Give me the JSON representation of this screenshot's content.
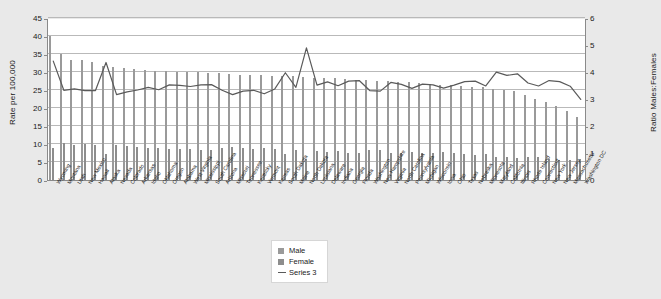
{
  "chart_data": {
    "type": "bar",
    "title": "",
    "subtitle": "",
    "xlabel": "",
    "ylabel": "Rate per 100,000",
    "y2label": "Ratio Males:Females",
    "ylim": [
      0,
      45
    ],
    "y2lim": [
      0,
      6
    ],
    "yticks": [
      0,
      5,
      10,
      15,
      20,
      25,
      30,
      35,
      40,
      45
    ],
    "y2ticks": [
      0,
      1,
      2,
      3,
      4,
      5,
      6
    ],
    "grid": true,
    "legend_position": "bottom-center",
    "categories": [
      "Wyoming",
      "Montana",
      "Utah",
      "New Mexico",
      "Hawaii",
      "Alaska",
      "Nevada",
      "Colorado",
      "Arkansas",
      "Idaho",
      "Oklahoma",
      "Oregon",
      "Alabama",
      "West Virginia",
      "Mississippi",
      "South Carolina",
      "Arizona",
      "Missouri",
      "Tennessee",
      "Kentucky",
      "Vermont",
      "Kansas",
      "South Dakota",
      "Maine",
      "North Dakota",
      "Louisiana",
      "Delaware",
      "Indiana",
      "Georgia",
      "Florida",
      "Washington",
      "New Hampshire",
      "Virginia",
      "North Carolina",
      "Pennsylvania",
      "Michigan",
      "Wisconsin",
      "Iowa",
      "Ohio",
      "Texas",
      "Nebraska",
      "Minnesota",
      "Maryland",
      "California",
      "Illinois",
      "Rhode Island",
      "Connecticut",
      "New York",
      "New Jersey",
      "Massachusetts",
      "Washington DC"
    ],
    "series": [
      {
        "name": "Male",
        "axis": "left",
        "color": "#9a9a9a",
        "values": [
          40.0,
          34.9,
          33.4,
          33.2,
          32.8,
          31.6,
          31.4,
          31.0,
          30.7,
          30.5,
          30.4,
          30.3,
          30.1,
          30.1,
          29.9,
          29.6,
          29.6,
          29.4,
          29.3,
          29.2,
          29.1,
          29.0,
          28.9,
          28.8,
          28.6,
          28.4,
          28.3,
          28.2,
          28.1,
          27.9,
          27.8,
          27.6,
          27.4,
          27.2,
          27.1,
          26.9,
          26.7,
          26.5,
          26.3,
          26.1,
          25.9,
          25.7,
          25.4,
          25.0,
          24.6,
          23.6,
          22.5,
          21.6,
          20.6,
          19.3,
          17.5
        ]
      },
      {
        "name": "Female",
        "axis": "left",
        "color": "#8d8d8d",
        "values": [
          9.0,
          10.4,
          9.8,
          9.9,
          9.8,
          7.2,
          9.8,
          9.4,
          9.1,
          8.8,
          9.0,
          8.5,
          8.5,
          8.6,
          8.4,
          8.3,
          8.8,
          9.2,
          8.8,
          8.7,
          9.0,
          8.5,
          7.2,
          8.3,
          5.8,
          8.0,
          7.7,
          8.0,
          7.6,
          7.5,
          8.3,
          8.3,
          7.5,
          7.6,
          7.9,
          7.5,
          7.5,
          7.7,
          7.4,
          7.1,
          7.0,
          7.3,
          6.3,
          6.4,
          6.2,
          6.5,
          6.4,
          5.8,
          5.6,
          5.5,
          5.8
        ]
      },
      {
        "name": "Series 3",
        "axis": "right",
        "color": "#5a5a5a",
        "values": [
          4.44,
          3.36,
          3.41,
          3.35,
          3.35,
          4.39,
          3.2,
          3.3,
          3.37,
          3.47,
          3.38,
          3.56,
          3.54,
          3.5,
          3.56,
          3.57,
          3.36,
          3.2,
          3.33,
          3.36,
          3.23,
          3.41,
          4.01,
          3.47,
          4.93,
          3.55,
          3.67,
          3.53,
          3.7,
          3.72,
          3.35,
          3.33,
          3.65,
          3.58,
          3.43,
          3.59,
          3.56,
          3.44,
          3.55,
          3.68,
          3.7,
          3.52,
          4.03,
          3.91,
          3.97,
          3.63,
          3.52,
          3.72,
          3.68,
          3.51,
          3.02
        ]
      }
    ],
    "legend": [
      {
        "label": "Male",
        "marker": "square",
        "color": "#9a9a9a"
      },
      {
        "label": "Female",
        "marker": "square",
        "color": "#8d8d8d"
      },
      {
        "label": "Series 3",
        "marker": "line",
        "color": "#5a5a5a"
      }
    ]
  }
}
